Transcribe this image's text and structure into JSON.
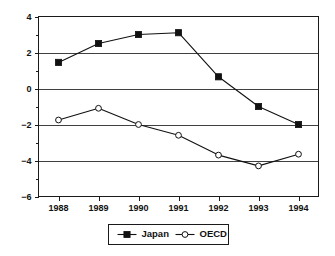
{
  "chart_data": {
    "type": "line",
    "title": "",
    "subtitle": "",
    "xlabel": "",
    "ylabel": "",
    "categories": [
      "1988",
      "1989",
      "1990",
      "1991",
      "1992",
      "1993",
      "1994"
    ],
    "x_tick_labels": [
      "1988",
      "1989",
      "1990",
      "1991",
      "1992",
      "1993",
      "1994"
    ],
    "y_tick_labels": [
      "4",
      "2",
      "0",
      "-2",
      "-4",
      "-6"
    ],
    "y_tick_values": [
      4,
      2,
      0,
      -2,
      -4,
      -6
    ],
    "y_minor_tick_values": [
      3,
      1,
      -1,
      -3,
      -5
    ],
    "ylim": [
      -6,
      4
    ],
    "grid": "horizontal",
    "gridline_values": [
      2,
      0,
      -2,
      -4
    ],
    "legend_position": "bottom-center",
    "series": [
      {
        "name": "Japan",
        "marker": "filled-square",
        "values": [
          1.45,
          2.5,
          3.0,
          3.1,
          0.65,
          -1.0,
          -2.0
        ]
      },
      {
        "name": "OECD",
        "marker": "open-circle",
        "values": [
          -1.75,
          -1.1,
          -2.0,
          -2.6,
          -3.7,
          -4.3,
          -3.65
        ]
      }
    ]
  },
  "legend": {
    "entries": [
      {
        "label": "Japan"
      },
      {
        "label": "OECD"
      }
    ]
  },
  "colors": {
    "ink": "#111111",
    "background": "#ffffff",
    "grid": "#2b2b2b"
  }
}
